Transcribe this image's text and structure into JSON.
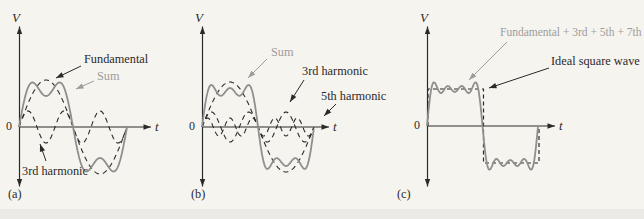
{
  "figure": {
    "background": "#f6f4ef"
  },
  "colors": {
    "ink": "#2a2a2a",
    "curve_gray": "#8f8f8f",
    "text_gray": "#9c9c9c"
  },
  "panels": [
    {
      "id": "a",
      "caption": "(a)",
      "v_axis_label": "V",
      "t_axis_label": "t",
      "origin_label": "0",
      "geometry": {
        "x0": 19,
        "y0": 127,
        "half_period": 54,
        "periods": 1
      },
      "curves": [
        {
          "name": "fundamental",
          "style": "dashed",
          "color": "ink",
          "width": 1.1,
          "harmonics": [
            {
              "n": 1,
              "amp": 47
            }
          ]
        },
        {
          "name": "3rd-harmonic",
          "style": "dashed",
          "color": "ink",
          "width": 1.1,
          "harmonics": [
            {
              "n": 3,
              "amp": 16
            }
          ]
        },
        {
          "name": "sum",
          "style": "solid",
          "color": "curve_gray",
          "width": 1.8,
          "harmonics": [
            {
              "n": 1,
              "amp": 47
            },
            {
              "n": 3,
              "amp": 16
            }
          ]
        }
      ],
      "annotations": [
        {
          "text": "Fundamental",
          "color": "ink"
        },
        {
          "text": "Sum",
          "color": "gray"
        },
        {
          "text": "3rd harmonic",
          "color": "ink"
        }
      ]
    },
    {
      "id": "b",
      "caption": "(b)",
      "v_axis_label": "V",
      "t_axis_label": "t",
      "origin_label": "0",
      "geometry": {
        "x0": 202,
        "y0": 127,
        "half_period": 56,
        "periods": 1
      },
      "curves": [
        {
          "name": "fundamental",
          "style": "dashed",
          "color": "ink",
          "width": 1.1,
          "harmonics": [
            {
              "n": 1,
              "amp": 45
            }
          ]
        },
        {
          "name": "3rd-harmonic",
          "style": "dashed",
          "color": "ink",
          "width": 1.1,
          "harmonics": [
            {
              "n": 3,
              "amp": 15
            }
          ]
        },
        {
          "name": "5th-harmonic",
          "style": "dashed",
          "color": "ink",
          "width": 1.1,
          "harmonics": [
            {
              "n": 5,
              "amp": 9
            }
          ]
        },
        {
          "name": "sum",
          "style": "solid",
          "color": "curve_gray",
          "width": 1.8,
          "harmonics": [
            {
              "n": 1,
              "amp": 45
            },
            {
              "n": 3,
              "amp": 15
            },
            {
              "n": 5,
              "amp": 9
            }
          ]
        }
      ],
      "annotations": [
        {
          "text": "Sum",
          "color": "gray"
        },
        {
          "text": "3rd harmonic",
          "color": "ink"
        },
        {
          "text": "5th harmonic",
          "color": "ink"
        }
      ]
    },
    {
      "id": "c",
      "caption": "(c)",
      "v_axis_label": "V",
      "t_axis_label": "t",
      "origin_label": "0",
      "geometry": {
        "x0": 427,
        "y0": 126,
        "half_period": 55.5,
        "periods": 1
      },
      "curves": [
        {
          "name": "ideal-square-wave",
          "type": "square",
          "style": "dashed",
          "color": "ink",
          "width": 1.2,
          "amp": 37,
          "dash": "4 3"
        },
        {
          "name": "sum",
          "style": "solid",
          "color": "curve_gray",
          "width": 1.8,
          "harmonics": [
            {
              "n": 1,
              "amp": 47
            },
            {
              "n": 3,
              "amp": 15.7
            },
            {
              "n": 5,
              "amp": 9.4
            },
            {
              "n": 7,
              "amp": 6.7
            }
          ]
        }
      ],
      "annotations": [
        {
          "text": "Fundamental + 3rd + 5th + 7th",
          "color": "gray"
        },
        {
          "text": "Ideal square wave",
          "color": "ink"
        }
      ]
    }
  ]
}
